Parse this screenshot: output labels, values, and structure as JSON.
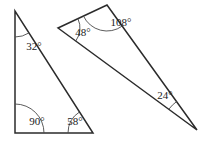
{
  "figure": {
    "background_color": "#ffffff",
    "line_color": "#2b2b2b",
    "arc_color": "#4a4a4a",
    "text_color": "#1a1a1a"
  },
  "chart_data": {
    "type": "diagram",
    "shapes": [
      {
        "name": "left-triangle",
        "vertices": [
          {
            "id": "A",
            "x": 15,
            "y": 11
          },
          {
            "id": "B",
            "x": 15,
            "y": 133
          },
          {
            "id": "C",
            "x": 93,
            "y": 133
          }
        ],
        "angles": [
          {
            "at": "A",
            "label": "32°",
            "value": 32,
            "label_x": 34,
            "label_y": 47,
            "arc_radius": 26
          },
          {
            "at": "B",
            "label": "90°",
            "value": 90,
            "label_x": 37,
            "label_y": 122,
            "arc_radius": 29
          },
          {
            "at": "C",
            "label": "58°",
            "value": 58,
            "label_x": 75,
            "label_y": 122,
            "arc_radius": 25
          }
        ]
      },
      {
        "name": "right-triangle",
        "vertices": [
          {
            "id": "D",
            "x": 58,
            "y": 28
          },
          {
            "id": "E",
            "x": 107,
            "y": 5
          },
          {
            "id": "F",
            "x": 197,
            "y": 130
          }
        ],
        "angles": [
          {
            "at": "D",
            "label": "48°",
            "value": 48,
            "label_x": 83,
            "label_y": 33,
            "arc_radius": 22
          },
          {
            "at": "E",
            "label": "108°",
            "value": 108,
            "label_x": 121,
            "label_y": 23,
            "arc_radius": 26
          },
          {
            "at": "F",
            "label": "24°",
            "value": 24,
            "label_x": 165,
            "label_y": 96,
            "arc_radius": 35
          }
        ]
      }
    ],
    "angle_labels": [
      "32°",
      "90°",
      "58°",
      "48°",
      "108°",
      "24°"
    ]
  }
}
